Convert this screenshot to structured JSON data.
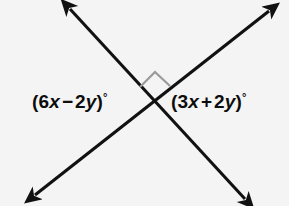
{
  "figure": {
    "background_color": "#f4f4f4",
    "line_color": "#111111",
    "marker_color": "#9a9a9a",
    "text_color": "#0d0d0d",
    "intersection": {
      "x": 152,
      "y": 100
    },
    "lines": [
      {
        "name": "line-top-left-to-bottom-right",
        "from": {
          "x": 67,
          "y": 5
        },
        "to": {
          "x": 248,
          "y": 203
        },
        "arrowheads": "both"
      },
      {
        "name": "line-bottom-left-to-top-right",
        "from": {
          "x": 31,
          "y": 198
        },
        "to": {
          "x": 273,
          "y": 7
        },
        "arrowheads": "both"
      }
    ],
    "right_angle_marker": {
      "name": "right-angle-square",
      "position": "top-vertical-angle",
      "apex": {
        "x": 155,
        "y": 73
      }
    },
    "labels": {
      "left": {
        "full_text": "(6x − 2y)°",
        "open_paren": "(",
        "coefficient_1": "6",
        "variable_1": "x",
        "operator": "−",
        "coefficient_2": "2",
        "variable_2": "y",
        "close_paren": ")",
        "degree": "°"
      },
      "right": {
        "full_text": "(3x + 2y)°",
        "open_paren": "(",
        "coefficient_1": "3",
        "variable_1": "x",
        "operator": "+",
        "coefficient_2": "2",
        "variable_2": "y",
        "close_paren": ")",
        "degree": "°"
      }
    }
  }
}
